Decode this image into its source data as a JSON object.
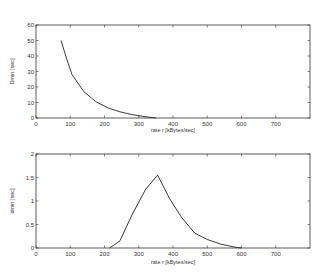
{
  "chart_data": [
    {
      "type": "line",
      "title": "",
      "xlabel": "rate r [kBytes/sec]",
      "ylabel": "Dmin [sec]",
      "xlim": [
        0,
        800
      ],
      "ylim": [
        0,
        60
      ],
      "xticks": [
        0,
        100,
        200,
        300,
        400,
        500,
        600,
        700
      ],
      "yticks": [
        0,
        10,
        20,
        30,
        40,
        50,
        60
      ],
      "grid": false,
      "legend": null,
      "series": [
        {
          "name": "Dmin",
          "x": [
            73,
            90,
            105,
            140,
            175,
            210,
            245,
            280,
            315,
            350
          ],
          "y": [
            50,
            38,
            28,
            17,
            10.5,
            6.5,
            4,
            2.2,
            1,
            0
          ]
        }
      ]
    },
    {
      "type": "line",
      "title": "",
      "xlabel": "rate r [kBytes/sec]",
      "ylabel": "dmin [sec]",
      "xlim": [
        0,
        800
      ],
      "ylim": [
        0,
        2
      ],
      "xticks": [
        0,
        100,
        200,
        300,
        400,
        500,
        600,
        700
      ],
      "yticks": [
        0,
        0.5,
        1,
        1.5,
        2
      ],
      "grid": false,
      "legend": null,
      "series": [
        {
          "name": "dmin",
          "x": [
            215,
            245,
            280,
            320,
            355,
            390,
            425,
            463,
            500,
            540,
            580,
            600
          ],
          "y": [
            0,
            0.15,
            0.7,
            1.25,
            1.55,
            1.05,
            0.65,
            0.32,
            0.18,
            0.08,
            0.02,
            0
          ]
        }
      ]
    }
  ]
}
